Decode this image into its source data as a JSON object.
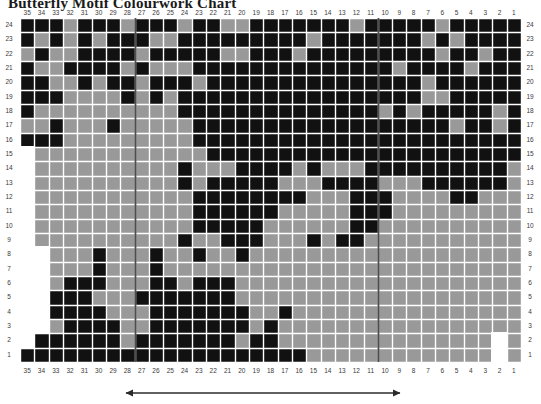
{
  "title": "Butterfly Motif Colourwork Chart",
  "colors": {
    "dark": "#111111",
    "light": "#999999",
    "grid_line": "#ffffff",
    "separator": "#4d4d4d",
    "label": "#3a3a3a",
    "background": "#ffffff",
    "arrow": "#2b2b2b"
  },
  "axes": {
    "top_labels": [
      35,
      34,
      33,
      32,
      31,
      30,
      29,
      28,
      27,
      26,
      25,
      24,
      23,
      22,
      21,
      20,
      19,
      18,
      17,
      16,
      15,
      14,
      13,
      12,
      11,
      10,
      9,
      8,
      7,
      6,
      5,
      4,
      3,
      2,
      1
    ],
    "bottom_labels": [
      35,
      34,
      33,
      32,
      31,
      30,
      29,
      28,
      27,
      26,
      25,
      24,
      23,
      22,
      21,
      20,
      19,
      18,
      17,
      16,
      15,
      14,
      13,
      12,
      11,
      10,
      9,
      8,
      7,
      6,
      5,
      4,
      3,
      2,
      1
    ],
    "left_labels": [
      24,
      23,
      22,
      21,
      20,
      19,
      18,
      17,
      16,
      15,
      14,
      13,
      12,
      11,
      10,
      9,
      8,
      7,
      6,
      5,
      4,
      3,
      2,
      1
    ],
    "right_labels": [
      24,
      23,
      22,
      21,
      20,
      19,
      18,
      17,
      16,
      15,
      14,
      13,
      12,
      11,
      10,
      9,
      8,
      7,
      6,
      5,
      4,
      3,
      2,
      1
    ],
    "columns": 35,
    "rows": 24
  },
  "legend": {
    "dark_label": "Main colour",
    "light_label": "Contrast colour"
  },
  "repeat": {
    "label": "",
    "start_column": 29,
    "end_column": 12
  },
  "separators": [
    {
      "after_column_index": 7
    },
    {
      "after_column_index": 24
    }
  ],
  "chart_data": {
    "type": "heatmap",
    "title": "Butterfly Motif Colourwork Chart",
    "xlabel": "",
    "ylabel": "",
    "x": [
      35,
      34,
      33,
      32,
      31,
      30,
      29,
      28,
      27,
      26,
      25,
      24,
      23,
      22,
      21,
      20,
      19,
      18,
      17,
      16,
      15,
      14,
      13,
      12,
      11,
      10,
      9,
      8,
      7,
      6,
      5,
      4,
      3,
      2,
      1
    ],
    "y": [
      24,
      23,
      22,
      21,
      20,
      19,
      18,
      17,
      16,
      15,
      14,
      13,
      12,
      11,
      10,
      9,
      8,
      7,
      6,
      5,
      4,
      3,
      2,
      1
    ],
    "value_legend": {
      "1": "dark stitch",
      "0": "light stitch",
      "-1": "no stitch"
    },
    "grid": [
      "11101110111011001111111011111011111",
      "10101011100111111111011111110101111",
      "01001111011111001110111111111011011",
      "10011110100011111111111111011110111",
      "11001011011101111111111111110111111",
      "11100001010111111111111111110011111",
      "10000000000111111111111110101111101",
      "00100010000011111111111111111101101",
      "11100000000011111111111111111111111",
      "-0000000000001111111111111111111111",
      "-0000000000100011110100011111111110",
      "-0000000000101111100011110001111110",
      "-0000000000011111111000111000011000",
      "-0000000000011111100000111000000000",
      "-0000000000011111000000110000000000",
      "-0000000000100111000101100000000000",
      "--000100010010010000000000000000000",
      "--000100010000000000000000000000000",
      "--011100011011100000000000000000000",
      "--111000111111100000000000000000000",
      "--111100011111110010000000000000000",
      "--011110011111110100000000000000000",
      "-11111101111111011000000000000000-0",
      "111111111111111111110000000000000-0"
    ]
  }
}
